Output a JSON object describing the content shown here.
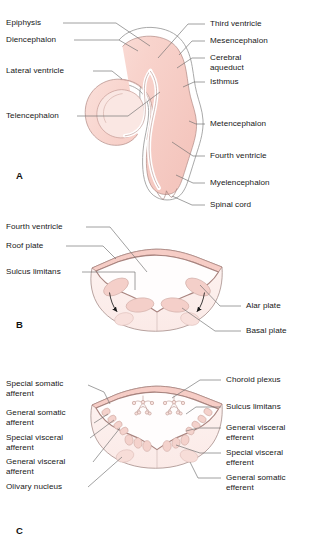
{
  "figure": {
    "background": "#ffffff",
    "colors": {
      "tissue_fill": "#f7d2cb",
      "tissue_fill_light": "#fbeae6",
      "outline": "#8a6a66",
      "outline_light": "#b79a95",
      "leader_line": "#6e6e6e",
      "text": "#171717",
      "nucleus_fill": "#f2cfc9",
      "arrow": "#1a1a1a"
    }
  },
  "panels": [
    {
      "id": "A",
      "letter": "A",
      "labels_left": [
        {
          "name": "epiphysis",
          "text": "Epiphysis"
        },
        {
          "name": "diencephalon",
          "text": "Diencephalon"
        },
        {
          "name": "lateral-ventricle",
          "text": "Lateral ventricle"
        },
        {
          "name": "telencephalon",
          "text": "Telencephalon"
        }
      ],
      "labels_right": [
        {
          "name": "third-ventricle",
          "text": "Third ventricle"
        },
        {
          "name": "mesencephalon",
          "text": "Mesencephalon"
        },
        {
          "name": "cerebral-aqueduct",
          "text": "Cerebral\naqueduct"
        },
        {
          "name": "isthmus",
          "text": "Isthmus"
        },
        {
          "name": "metencephalon",
          "text": "Metencephalon"
        },
        {
          "name": "fourth-ventricle",
          "text": "Fourth ventricle"
        },
        {
          "name": "myelencephalon",
          "text": "Myelencephalon"
        },
        {
          "name": "spinal-cord",
          "text": "Spinal cord"
        }
      ]
    },
    {
      "id": "B",
      "letter": "B",
      "labels_left": [
        {
          "name": "fourth-ventricle",
          "text": "Fourth ventricle"
        },
        {
          "name": "roof-plate",
          "text": "Roof plate"
        },
        {
          "name": "sulcus-limitans",
          "text": "Sulcus limitans"
        }
      ],
      "labels_right": [
        {
          "name": "alar-plate",
          "text": "Alar plate"
        },
        {
          "name": "basal-plate",
          "text": "Basal plate"
        }
      ]
    },
    {
      "id": "C",
      "letter": "C",
      "labels_left": [
        {
          "name": "special-somatic-afferent",
          "text": "Special somatic\nafferent"
        },
        {
          "name": "general-somatic-afferent",
          "text": "General somatic\nafferent"
        },
        {
          "name": "special-visceral-afferent",
          "text": "Special visceral\nafferent"
        },
        {
          "name": "general-visceral-afferent",
          "text": "General visceral\nafferent"
        },
        {
          "name": "olivary-nucleus",
          "text": "Olivary nucleus"
        }
      ],
      "labels_right": [
        {
          "name": "choroid-plexus",
          "text": "Choroid plexus"
        },
        {
          "name": "sulcus-limitans",
          "text": "Sulcus limitans"
        },
        {
          "name": "general-visceral-efferent",
          "text": "General visceral\nefferent"
        },
        {
          "name": "special-visceral-efferent",
          "text": "Special visceral\nefferent"
        },
        {
          "name": "general-somatic-efferent",
          "text": "General somatic\nefferent"
        }
      ]
    }
  ]
}
